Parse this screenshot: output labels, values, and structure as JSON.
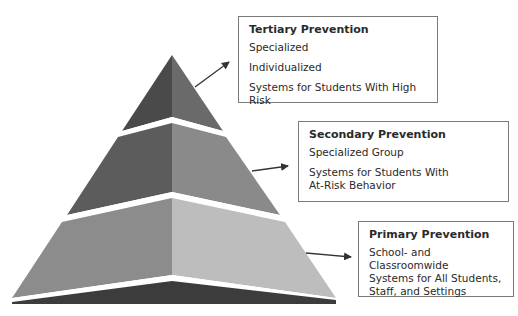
{
  "diagram": {
    "type": "pyramid",
    "tiers": [
      {
        "id": "tertiary",
        "title": "Tertiary Prevention",
        "lines": [
          "Specialized",
          "Individualized",
          "Systems for Students With High Risk"
        ]
      },
      {
        "id": "secondary",
        "title": "Secondary Prevention",
        "lines": [
          "Specialized Group",
          "Systems for Students With",
          "At-Risk Behavior"
        ]
      },
      {
        "id": "primary",
        "title": "Primary Prevention",
        "lines": [
          "School- and Classroomwide",
          "Systems for All Students,",
          "Staff, and Settings"
        ]
      }
    ],
    "colors": {
      "tier1_left": "#4a4a4a",
      "tier1_right": "#6a6a6a",
      "tier2_left": "#5c5c5c",
      "tier2_right": "#8a8a8a",
      "tier3_left": "#8c8c8c",
      "tier3_right": "#bdbdbd",
      "base": "#3c3c3c",
      "separator": "#ffffff",
      "arrow": "#333333",
      "box_border": "#7a7a7a"
    }
  }
}
